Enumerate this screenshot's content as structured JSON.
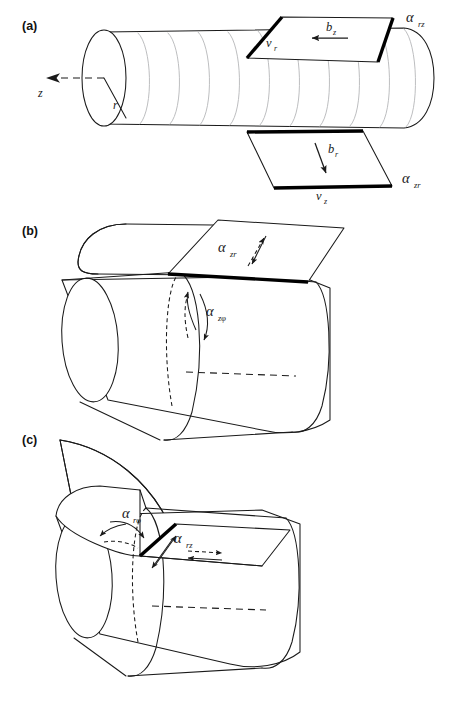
{
  "figure": {
    "background_color": "#ffffff",
    "line_color": "#1a1a1a",
    "helix_color": "#b9bbbd",
    "thick_edge_color": "#000000"
  },
  "panels": [
    {
      "id": "a",
      "tag": "(a)",
      "axes": [
        {
          "name": "z-axis-label",
          "symbol": "z",
          "sub": ""
        },
        {
          "name": "r-radius-label",
          "symbol": "r",
          "sub": ""
        }
      ],
      "top_plane": {
        "name": "top-cut-plane",
        "alpha": {
          "symbol": "α",
          "sub": "rz"
        },
        "line_vector": {
          "symbol": "v",
          "sub": "r"
        },
        "burgers_vector": {
          "symbol": "b",
          "sub": "z"
        }
      },
      "bottom_plane": {
        "name": "bottom-cut-plane",
        "alpha": {
          "symbol": "α",
          "sub": "zr"
        },
        "line_vector": {
          "symbol": "v",
          "sub": "z"
        },
        "burgers_vector": {
          "symbol": "b",
          "sub": "r"
        }
      }
    },
    {
      "id": "b",
      "tag": "(b)",
      "plane": {
        "name": "axial-cut-plane",
        "alpha": {
          "symbol": "α",
          "sub": "zr"
        }
      },
      "surface": {
        "name": "azimuthal-rotation",
        "alpha": {
          "symbol": "α",
          "sub": "zφ"
        }
      }
    },
    {
      "id": "c",
      "tag": "(c)",
      "sector": {
        "name": "radial-wedge",
        "alpha": {
          "symbol": "α",
          "sub": "rφ"
        }
      },
      "plane": {
        "name": "radial-cut-plane",
        "alpha": {
          "symbol": "α",
          "sub": "rz"
        }
      }
    }
  ]
}
